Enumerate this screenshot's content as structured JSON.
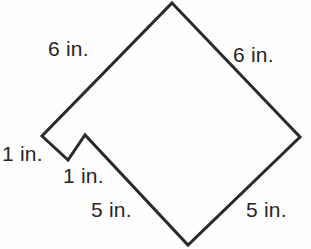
{
  "figure": {
    "units": "in.",
    "stroke_color": "#2a2a2a",
    "background_color": "#fefefe",
    "stroke_width": 3,
    "canvas": {
      "width": 311,
      "height": 249
    },
    "vertices": [
      {
        "name": "top-apex",
        "x": 172,
        "y": 3
      },
      {
        "name": "right-apex",
        "x": 300,
        "y": 137
      },
      {
        "name": "bottom-apex",
        "x": 188,
        "y": 245
      },
      {
        "name": "notch-outer-peak",
        "x": 85,
        "y": 135
      },
      {
        "name": "notch-inner-valley",
        "x": 68,
        "y": 160
      },
      {
        "name": "left-apex",
        "x": 42,
        "y": 136
      }
    ],
    "path": "M 172 3 L 300 137 L 188 245 L 85 135 L 68 160 L 42 136 Z",
    "labels": [
      {
        "name": "top-left-side",
        "text": "6 in.",
        "value": 6,
        "unit": "in."
      },
      {
        "name": "top-right-side",
        "text": "6 in.",
        "value": 6,
        "unit": "in."
      },
      {
        "name": "left-notch-side",
        "text": "1 in.",
        "value": 1,
        "unit": "in."
      },
      {
        "name": "inner-notch-side",
        "text": "1 in.",
        "value": 1,
        "unit": "in."
      },
      {
        "name": "bottom-left-side",
        "text": "5 in.",
        "value": 5,
        "unit": "in."
      },
      {
        "name": "bottom-right-side",
        "text": "5 in.",
        "value": 5,
        "unit": "in."
      }
    ]
  }
}
